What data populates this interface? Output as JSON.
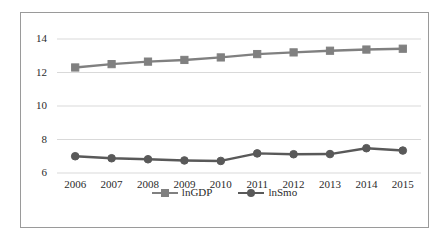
{
  "chart_data": {
    "type": "line",
    "title": "",
    "xlabel": "",
    "ylabel": "",
    "categories": [
      "2006",
      "2007",
      "2008",
      "2009",
      "2010",
      "2011",
      "2012",
      "2013",
      "2014",
      "2015"
    ],
    "series": [
      {
        "name": "lnGDP",
        "marker": "square",
        "color": "#808080",
        "values": [
          12.3,
          12.5,
          12.65,
          12.75,
          12.9,
          13.1,
          13.2,
          13.3,
          13.37,
          13.42
        ]
      },
      {
        "name": "lnSmo",
        "marker": "circle",
        "color": "#595959",
        "values": [
          7.0,
          6.88,
          6.82,
          6.75,
          6.72,
          7.17,
          7.12,
          7.13,
          7.48,
          7.34
        ]
      }
    ],
    "ylim": [
      6,
      14
    ],
    "yticks": [
      6,
      8,
      10,
      12,
      14
    ],
    "ytick_labels": [
      "6",
      "8",
      "10",
      "12",
      "14"
    ],
    "grid": true,
    "grid_color": "#d9d9d9",
    "legend_position": "bottom",
    "legend_entries": [
      "lnGDP",
      "lnSmo"
    ],
    "axis_color": "#bfbfbf",
    "border_color": "#9a9a9a",
    "background": "#ffffff"
  }
}
